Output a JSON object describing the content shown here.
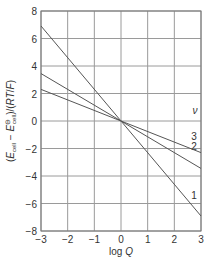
{
  "chart_data": {
    "type": "line",
    "title": "",
    "xlabel": "log Q",
    "ylabel": "(E_cell − E°_cell)/(RT/F)",
    "xlim": [
      -3,
      3
    ],
    "ylim": [
      -8,
      8
    ],
    "xticks": [
      "−3",
      "−2",
      "−1",
      "0",
      "1",
      "2",
      "3"
    ],
    "yticks": [
      "8",
      "6",
      "4",
      "2",
      "0",
      "−2",
      "−4",
      "−6",
      "−8"
    ],
    "grid": true,
    "legend_title": "ν",
    "series": [
      {
        "name": "1",
        "x": [
          -3,
          3
        ],
        "y": [
          6.91,
          -6.91
        ]
      },
      {
        "name": "2",
        "x": [
          -3,
          3
        ],
        "y": [
          3.45,
          -3.45
        ]
      },
      {
        "name": "3",
        "x": [
          -3,
          3
        ],
        "y": [
          2.3,
          -2.3
        ]
      }
    ]
  }
}
